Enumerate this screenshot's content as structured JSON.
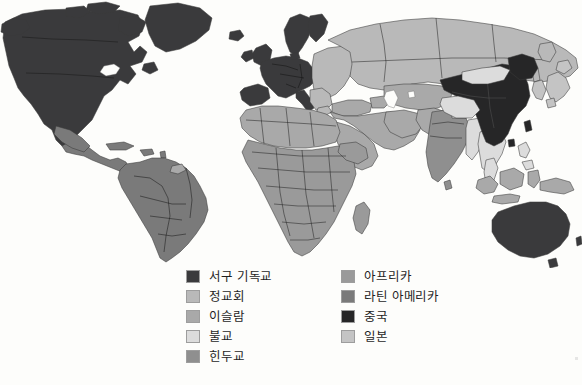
{
  "figure": {
    "background_color": "#fdfdfb"
  },
  "palette": {
    "western_christianity": "#3a3a3c",
    "orthodox": "#b9b9b9",
    "islam": "#a9a9a9",
    "buddhism": "#dcdcdc",
    "hinduism": "#8f8f8f",
    "africa": "#9a9a9a",
    "latin_america": "#7a7a7a",
    "china": "#262627",
    "japan": "#c4c4c4",
    "border": "#3a3a3a",
    "swatch_border": "#9d9d9d",
    "text": "#1f1f1f"
  },
  "legend": {
    "left_column": [
      {
        "label": "서구 기독교",
        "color": "#3a3a3c",
        "key": "western_christianity"
      },
      {
        "label": "정교회",
        "color": "#b9b9b9",
        "key": "orthodox"
      },
      {
        "label": "이슬람",
        "color": "#a9a9a9",
        "key": "islam"
      },
      {
        "label": "불교",
        "color": "#dcdcdc",
        "key": "buddhism"
      },
      {
        "label": "힌두교",
        "color": "#8f8f8f",
        "key": "hinduism"
      }
    ],
    "right_column": [
      {
        "label": "아프리카",
        "color": "#9a9a9a",
        "key": "africa"
      },
      {
        "label": "라틴 아메리카",
        "color": "#7a7a7a",
        "key": "latin_america"
      },
      {
        "label": "중국",
        "color": "#262627",
        "key": "china"
      },
      {
        "label": "일본",
        "color": "#c4c4c4",
        "key": "japan"
      }
    ]
  },
  "map_regions": [
    {
      "name": "북아메리카",
      "category": "서구 기독교",
      "color": "#3a3a3c"
    },
    {
      "name": "서유럽",
      "category": "서구 기독교",
      "color": "#3a3a3c"
    },
    {
      "name": "오스트레일리아",
      "category": "서구 기독교",
      "color": "#3a3a3c"
    },
    {
      "name": "러시아",
      "category": "정교회",
      "color": "#b9b9b9"
    },
    {
      "name": "동유럽",
      "category": "정교회",
      "color": "#b9b9b9"
    },
    {
      "name": "북아프리카",
      "category": "이슬람",
      "color": "#a9a9a9"
    },
    {
      "name": "중동",
      "category": "이슬람",
      "color": "#a9a9a9"
    },
    {
      "name": "중앙아시아",
      "category": "이슬람",
      "color": "#a9a9a9"
    },
    {
      "name": "인도네시아",
      "category": "이슬람",
      "color": "#a9a9a9"
    },
    {
      "name": "몽골",
      "category": "불교",
      "color": "#dcdcdc"
    },
    {
      "name": "동남아시아",
      "category": "불교",
      "color": "#dcdcdc"
    },
    {
      "name": "인도",
      "category": "힌두교",
      "color": "#8f8f8f"
    },
    {
      "name": "사하라 이남 아프리카",
      "category": "아프리카",
      "color": "#9a9a9a"
    },
    {
      "name": "남아메리카",
      "category": "라틴 아메리카",
      "color": "#7a7a7a"
    },
    {
      "name": "중앙아메리카",
      "category": "라틴 아메리카",
      "color": "#7a7a7a"
    },
    {
      "name": "중국",
      "category": "중국",
      "color": "#262627"
    },
    {
      "name": "일본",
      "category": "일본",
      "color": "#c4c4c4"
    },
    {
      "name": "한국",
      "category": "일본",
      "color": "#c4c4c4"
    }
  ]
}
